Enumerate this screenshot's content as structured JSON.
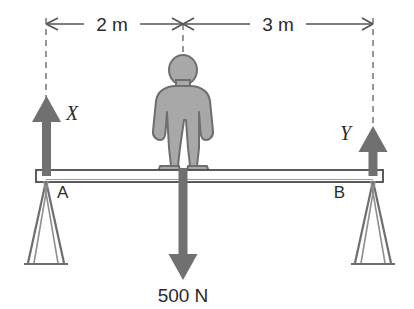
{
  "diagram": {
    "background_color": "#ffffff",
    "line_color": "#4a4a4a",
    "text_color": "#2b2b2b",
    "arrow_fill": "#707070",
    "person_fill": "#a8a8a8",
    "person_stroke": "#6e6e6e",
    "plank_fill": "#ffffff",
    "plank_stroke": "#4a4a4a"
  },
  "dimensions": {
    "left_span": "2 m",
    "right_span": "3 m"
  },
  "forces": {
    "left_reaction": "X",
    "right_reaction": "Y",
    "weight": "500 N"
  },
  "supports": {
    "left_label": "A",
    "right_label": "B"
  },
  "icons": {
    "up_arrow_left": "up-arrow-icon",
    "up_arrow_right": "up-arrow-icon",
    "down_arrow": "down-arrow-icon",
    "person": "person-figure-icon",
    "trestle_left": "trestle-support-icon",
    "trestle_right": "trestle-support-icon"
  }
}
